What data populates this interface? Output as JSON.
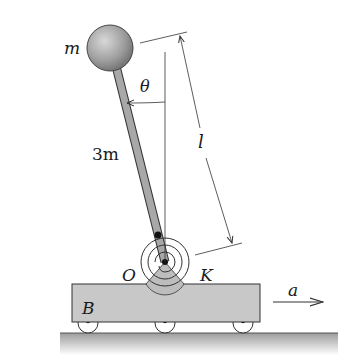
{
  "diagram": {
    "labels": {
      "sphere_mass": "m",
      "rod_mass": "3m",
      "angle": "θ",
      "length": "l",
      "pivot": "O",
      "spring": "K",
      "cart": "B",
      "acceleration": "a"
    },
    "colors": {
      "sphere": "#9a9a9a",
      "rod": "#a8a8a8",
      "cart": "#c8c8c8",
      "ground": "#b8b8b8",
      "line": "#333333"
    }
  }
}
